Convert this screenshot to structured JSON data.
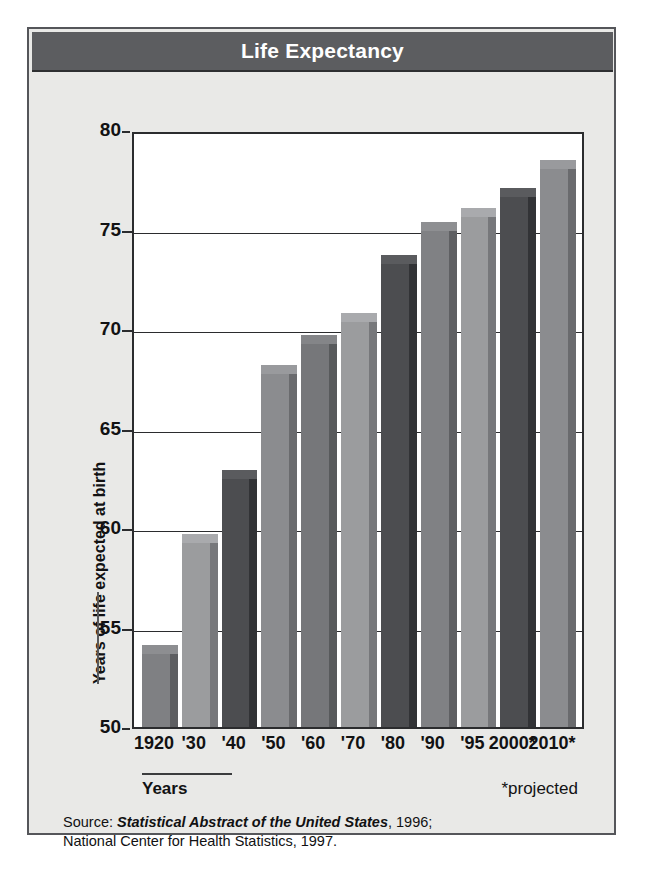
{
  "figure": {
    "title": "Life Expectancy",
    "background_color": "#e9e9e7",
    "title_bar_color": "#5c5d60",
    "border_color": "#55565a"
  },
  "axis": {
    "y_title": "Years of life expected at birth",
    "x_title": "Years",
    "y_ticks": [
      "80",
      "75",
      "70",
      "65",
      "60",
      "55",
      "50"
    ],
    "footnote": "*projected"
  },
  "source": {
    "line1_prefix": "Source: ",
    "line1_italic": "Statistical Abstract of the United States",
    "line1_suffix": ", 1996;",
    "line2": "National Center for Health Statistics, 1997."
  },
  "chart_data": {
    "type": "bar",
    "title": "Life Expectancy",
    "xlabel": "Years",
    "ylabel": "Years of life expected at birth",
    "ylim": [
      50,
      80
    ],
    "yticks": [
      50,
      55,
      60,
      65,
      70,
      75,
      80
    ],
    "grid": true,
    "legend": null,
    "annotations": [
      "*projected"
    ],
    "categories": [
      "1920",
      "'30",
      "'40",
      "'50",
      "'60",
      "'70",
      "'80",
      "'90",
      "'95",
      "2000*",
      "2010*"
    ],
    "values": [
      54.1,
      59.7,
      62.9,
      68.2,
      69.7,
      70.8,
      73.7,
      75.4,
      76.1,
      77.1,
      78.5
    ],
    "bar_colors": [
      "#7f8083",
      "#9b9c9e",
      "#4c4d50",
      "#8b8c8f",
      "#76777a",
      "#9b9c9e",
      "#4c4d50",
      "#808184",
      "#9b9c9e",
      "#4c4d50",
      "#8b8c8f"
    ],
    "bar_side_colors": [
      "#5e5f62",
      "#77787b",
      "#323336",
      "#6a6b6e",
      "#585a5c",
      "#77787b",
      "#323336",
      "#5f6063",
      "#77787b",
      "#323336",
      "#6a6b6e"
    ],
    "bar_cap_colors": [
      "#8d8e91",
      "#a9aaad",
      "#5a5b5e",
      "#999a9d",
      "#848588",
      "#a9aaad",
      "#5a5b5e",
      "#8e8f92",
      "#a9aaad",
      "#5a5b5e",
      "#999a9d"
    ]
  }
}
